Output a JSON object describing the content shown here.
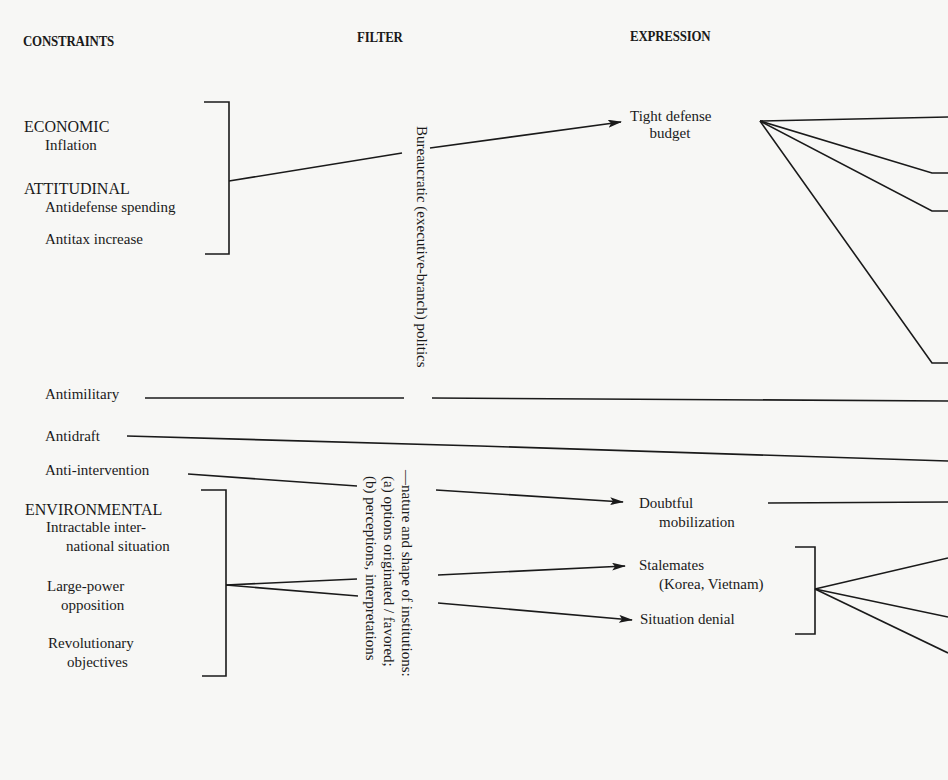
{
  "headers": {
    "constraints": "CONSTRAINTS",
    "filter": "FILTER",
    "expression": "EXPRESSION"
  },
  "constraints": {
    "economic": {
      "category": "ECONOMIC",
      "items": [
        "Inflation"
      ]
    },
    "attitudinal": {
      "category": "ATTITUDINAL",
      "items": [
        "Antidefense spending",
        "Antitax increase"
      ]
    },
    "standalone": [
      "Antimilitary",
      "Antidraft",
      "Anti-intervention"
    ],
    "environmental": {
      "category": "ENVIRONMENTAL",
      "items": [
        "Intractable inter-",
        "national situation",
        "Large-power",
        "opposition",
        "Revolutionary",
        "objectives"
      ]
    }
  },
  "filter": {
    "bureaucratic": "Bureaucratic (executive-branch) politics",
    "institutions_line1": "—nature and shape of institutions:",
    "institutions_line2": "(a) options originated / favored;",
    "institutions_line3": "(b) perceptions, interpretations"
  },
  "expression": {
    "tight_budget": [
      "Tight defense",
      "budget"
    ],
    "doubtful_mobilization": [
      "Doubtful",
      "mobilization"
    ],
    "stalemates": [
      "Stalemates",
      "(Korea, Vietnam)"
    ],
    "situation_denial": "Situation denial"
  }
}
